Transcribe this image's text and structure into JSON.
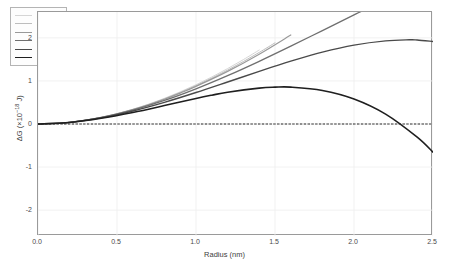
{
  "chart_data": {
    "type": "line",
    "title": "",
    "xlabel": "Radius (nm)",
    "ylabel": "ΔG (×10⁻¹⁸ J)",
    "ylabel_base": "ΔG (×10",
    "ylabel_exp": "-18",
    "ylabel_tail": " J)",
    "xlim": [
      0.0,
      2.5
    ],
    "ylim": [
      -2.6,
      2.6
    ],
    "xticks": [
      "0.0",
      "0.5",
      "1.0",
      "1.5",
      "2.0",
      "2.5"
    ],
    "xtick_values": [
      0.0,
      0.5,
      1.0,
      1.5,
      2.0,
      2.5
    ],
    "yticks": [
      "2",
      "1",
      "0",
      "-1",
      "-2"
    ],
    "ytick_values": [
      2,
      1,
      0,
      -1,
      -2
    ],
    "grid": true,
    "zero_line": true,
    "legend_position": "top-left",
    "legend_title": "",
    "series": [
      {
        "name": "S = 0.5",
        "label_var": "S",
        "label_val": "0.5",
        "S": 0.5,
        "color": "#d5d5d5",
        "width": 1.0,
        "x": [
          0.0,
          0.1,
          0.2,
          0.3,
          0.4,
          0.5,
          0.6,
          0.7,
          0.8,
          0.9,
          1.0,
          1.1,
          1.2,
          1.3,
          1.4
        ],
        "y": [
          0.0,
          0.01,
          0.04,
          0.089,
          0.156,
          0.241,
          0.343,
          0.461,
          0.596,
          0.746,
          0.911,
          1.091,
          1.286,
          1.495,
          1.717
        ]
      },
      {
        "name": "S = 0.75",
        "label_var": "S",
        "label_val": "0.75",
        "S": 0.75,
        "color": "#bdbdbd",
        "width": 1.0,
        "x": [
          0.0,
          0.1,
          0.2,
          0.3,
          0.4,
          0.5,
          0.6,
          0.7,
          0.8,
          0.9,
          1.0,
          1.1,
          1.2,
          1.3,
          1.4,
          1.5
        ],
        "y": [
          0.0,
          0.01,
          0.04,
          0.088,
          0.154,
          0.238,
          0.338,
          0.454,
          0.585,
          0.731,
          0.891,
          1.064,
          1.251,
          1.45,
          1.661,
          1.884
        ]
      },
      {
        "name": "S = 1",
        "label_var": "S",
        "label_val": "1",
        "S": 1.0,
        "color": "#999999",
        "width": 1.2,
        "x": [
          0.0,
          0.1,
          0.2,
          0.3,
          0.4,
          0.5,
          0.6,
          0.7,
          0.8,
          0.9,
          1.0,
          1.2,
          1.4,
          1.6
        ],
        "y": [
          0.0,
          0.01,
          0.04,
          0.088,
          0.154,
          0.236,
          0.334,
          0.448,
          0.576,
          0.718,
          0.874,
          1.222,
          1.621,
          2.066
        ]
      },
      {
        "name": "S = 1.5",
        "label_var": "S",
        "label_val": "1.5",
        "S": 1.5,
        "color": "#6f6f6f",
        "width": 1.3,
        "x": [
          0.0,
          0.2,
          0.4,
          0.6,
          0.8,
          1.0,
          1.2,
          1.4,
          1.6,
          1.8,
          2.0,
          2.2,
          2.4,
          2.5
        ],
        "y": [
          0.0,
          0.039,
          0.149,
          0.321,
          0.546,
          0.816,
          1.122,
          1.455,
          1.807,
          2.169,
          2.532,
          2.888,
          3.228,
          3.39
        ]
      },
      {
        "name": "S = 2",
        "label_var": "S",
        "label_val": "2",
        "S": 2.0,
        "color": "#4a4a4a",
        "width": 1.4,
        "x": [
          0.0,
          0.2,
          0.4,
          0.6,
          0.8,
          1.0,
          1.2,
          1.4,
          1.5,
          1.6,
          1.8,
          2.0,
          2.2,
          2.35,
          2.4,
          2.5
        ],
        "y": [
          0.0,
          0.038,
          0.144,
          0.303,
          0.503,
          0.731,
          0.975,
          1.222,
          1.342,
          1.458,
          1.668,
          1.832,
          1.93,
          1.955,
          1.95,
          1.915
        ]
      },
      {
        "name": "S = 3",
        "label_var": "S",
        "label_val": "3",
        "S": 3.0,
        "color": "#1f1f1f",
        "width": 1.6,
        "x": [
          0.0,
          0.2,
          0.4,
          0.6,
          0.8,
          1.0,
          1.1,
          1.2,
          1.4,
          1.5,
          1.6,
          1.8,
          2.0,
          2.2,
          2.4,
          2.5
        ],
        "y": [
          0.0,
          0.036,
          0.132,
          0.268,
          0.428,
          0.593,
          0.669,
          0.738,
          0.833,
          0.855,
          0.857,
          0.779,
          0.581,
          0.23,
          -0.306,
          -0.655
        ]
      },
      {
        "name": "zero",
        "S": null,
        "color": "#222222",
        "width": 1.0,
        "dashed": true,
        "x": [
          0.0,
          2.5
        ],
        "y": [
          0.0,
          0.0
        ]
      }
    ],
    "model": {
      "equation": "dG(r) = A*r^2 - B*ln(S)*r^3",
      "A": 0.94,
      "B": 0.615,
      "note": "classical nucleation theory free energy barrier, r in nm, dG in 1e-18 J"
    }
  },
  "axes": {
    "x_title": "Radius (nm)",
    "y_title_parts": {
      "base": "ΔG (×10",
      "exp": "−18",
      "tail": " J)"
    }
  },
  "legend": {
    "entries": [
      {
        "label": "S = 0.5"
      },
      {
        "label": "S = 0.75"
      },
      {
        "label": "S = 1"
      },
      {
        "label": "S = 1.5"
      },
      {
        "label": "S = 2"
      },
      {
        "label": "S = 3"
      }
    ]
  }
}
